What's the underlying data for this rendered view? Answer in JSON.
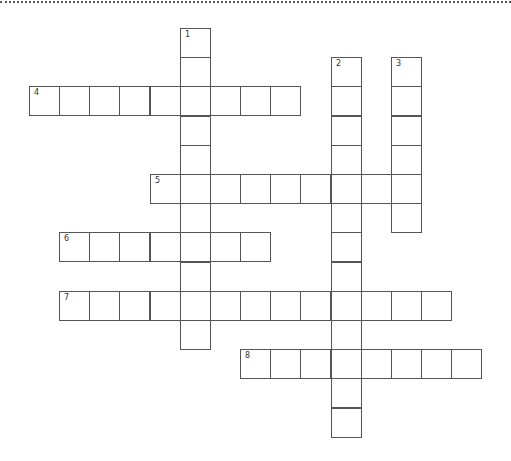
{
  "puzzle": {
    "type": "crossword",
    "grid_origin": {
      "x": 29,
      "y": 28
    },
    "cell_pitch": {
      "x": 30.15,
      "y": 29.2
    },
    "border_color": "#555555",
    "words": [
      {
        "number": "1",
        "direction": "down",
        "row": 0,
        "col": 5,
        "length": 11
      },
      {
        "number": "2",
        "direction": "down",
        "row": 1,
        "col": 10,
        "length": 13
      },
      {
        "number": "3",
        "direction": "down",
        "row": 1,
        "col": 12,
        "length": 6
      },
      {
        "number": "4",
        "direction": "across",
        "row": 2,
        "col": 0,
        "length": 9
      },
      {
        "number": "5",
        "direction": "across",
        "row": 5,
        "col": 4,
        "length": 9
      },
      {
        "number": "6",
        "direction": "across",
        "row": 7,
        "col": 1,
        "length": 7
      },
      {
        "number": "7",
        "direction": "across",
        "row": 9,
        "col": 1,
        "length": 13
      },
      {
        "number": "8",
        "direction": "across",
        "row": 11,
        "col": 7,
        "length": 8
      }
    ]
  }
}
